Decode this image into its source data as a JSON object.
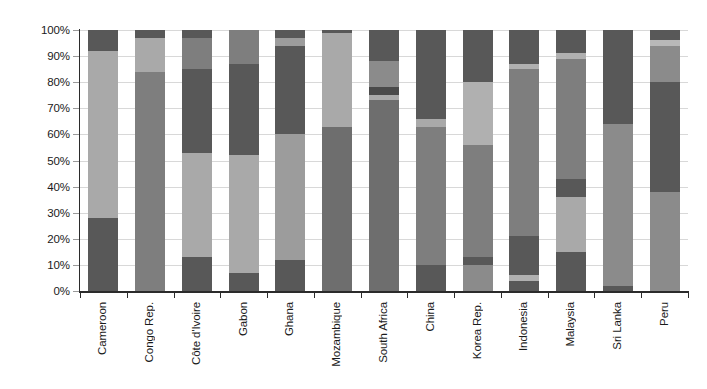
{
  "chart_data": {
    "type": "bar",
    "subtype": "stacked-bar-100-percent",
    "title": "",
    "subtitle": "",
    "xlabel": "",
    "ylabel": "",
    "ylim": [
      0,
      100
    ],
    "grid": true,
    "legend": "none",
    "y_tick_labels": [
      "0%",
      "10%",
      "20%",
      "30%",
      "40%",
      "50%",
      "60%",
      "70%",
      "80%",
      "90%",
      "100%"
    ],
    "y_tick_values": [
      0,
      10,
      20,
      30,
      40,
      50,
      60,
      70,
      80,
      90,
      100
    ],
    "categories": [
      "Cameroon",
      "Congo Rep.",
      "Côte d'Ivoire",
      "Gabon",
      "Ghana",
      "Mozambique",
      "South Africa",
      "China",
      "Korea Rep.",
      "Indonesia",
      "Malaysia",
      "Sri Lanka",
      "Peru"
    ],
    "colors": {
      "dark": "#585858",
      "dark_extra": "#4a4a4a",
      "medium": "#7e7e7e",
      "light": "#a9a9a9",
      "pale": "#c4c4c4"
    },
    "stacks": [
      {
        "category": "Cameroon",
        "segments": [
          {
            "from": 0,
            "to": 28,
            "value": 28,
            "color": "#585858"
          },
          {
            "from": 28,
            "to": 92,
            "value": 64,
            "color": "#a9a9a9"
          },
          {
            "from": 92,
            "to": 100,
            "value": 8,
            "color": "#585858"
          }
        ]
      },
      {
        "category": "Congo Rep.",
        "segments": [
          {
            "from": 0,
            "to": 84,
            "value": 84,
            "color": "#7e7e7e"
          },
          {
            "from": 84,
            "to": 97,
            "value": 13,
            "color": "#a9a9a9"
          },
          {
            "from": 97,
            "to": 100,
            "value": 3,
            "color": "#585858"
          }
        ]
      },
      {
        "category": "Côte d'Ivoire",
        "segments": [
          {
            "from": 0,
            "to": 13,
            "value": 13,
            "color": "#585858"
          },
          {
            "from": 13,
            "to": 53,
            "value": 40,
            "color": "#a9a9a9"
          },
          {
            "from": 53,
            "to": 85,
            "value": 32,
            "color": "#585858"
          },
          {
            "from": 85,
            "to": 97,
            "value": 12,
            "color": "#7e7e7e"
          },
          {
            "from": 97,
            "to": 100,
            "value": 3,
            "color": "#585858"
          }
        ]
      },
      {
        "category": "Gabon",
        "segments": [
          {
            "from": 0,
            "to": 7,
            "value": 7,
            "color": "#585858"
          },
          {
            "from": 7,
            "to": 52,
            "value": 45,
            "color": "#a9a9a9"
          },
          {
            "from": 52,
            "to": 87,
            "value": 35,
            "color": "#585858"
          },
          {
            "from": 87,
            "to": 100,
            "value": 13,
            "color": "#7e7e7e"
          }
        ]
      },
      {
        "category": "Ghana",
        "segments": [
          {
            "from": 0,
            "to": 12,
            "value": 12,
            "color": "#585858"
          },
          {
            "from": 12,
            "to": 60,
            "value": 48,
            "color": "#9c9c9c"
          },
          {
            "from": 60,
            "to": 94,
            "value": 34,
            "color": "#585858"
          },
          {
            "from": 94,
            "to": 97,
            "value": 3,
            "color": "#9c9c9c"
          },
          {
            "from": 97,
            "to": 100,
            "value": 3,
            "color": "#585858"
          }
        ]
      },
      {
        "category": "Mozambique",
        "segments": [
          {
            "from": 0,
            "to": 63,
            "value": 63,
            "color": "#6e6e6e"
          },
          {
            "from": 63,
            "to": 99,
            "value": 36,
            "color": "#a9a9a9"
          },
          {
            "from": 99,
            "to": 100,
            "value": 1,
            "color": "#585858"
          }
        ]
      },
      {
        "category": "South Africa",
        "segments": [
          {
            "from": 0,
            "to": 73,
            "value": 73,
            "color": "#6e6e6e"
          },
          {
            "from": 73,
            "to": 75,
            "value": 2,
            "color": "#a9a9a9"
          },
          {
            "from": 75,
            "to": 78,
            "value": 3,
            "color": "#4a4a4a"
          },
          {
            "from": 78,
            "to": 88,
            "value": 10,
            "color": "#8b8b8b"
          },
          {
            "from": 88,
            "to": 100,
            "value": 12,
            "color": "#585858"
          }
        ]
      },
      {
        "category": "China",
        "segments": [
          {
            "from": 0,
            "to": 10,
            "value": 10,
            "color": "#585858"
          },
          {
            "from": 10,
            "to": 63,
            "value": 53,
            "color": "#7e7e7e"
          },
          {
            "from": 63,
            "to": 66,
            "value": 3,
            "color": "#a9a9a9"
          },
          {
            "from": 66,
            "to": 100,
            "value": 34,
            "color": "#585858"
          }
        ]
      },
      {
        "category": "Korea Rep.",
        "segments": [
          {
            "from": 0,
            "to": 10,
            "value": 10,
            "color": "#8b8b8b"
          },
          {
            "from": 10,
            "to": 13,
            "value": 3,
            "color": "#585858"
          },
          {
            "from": 13,
            "to": 56,
            "value": 43,
            "color": "#7e7e7e"
          },
          {
            "from": 56,
            "to": 80,
            "value": 24,
            "color": "#b0b0b0"
          },
          {
            "from": 80,
            "to": 100,
            "value": 20,
            "color": "#585858"
          }
        ]
      },
      {
        "category": "Indonesia",
        "segments": [
          {
            "from": 0,
            "to": 4,
            "value": 4,
            "color": "#585858"
          },
          {
            "from": 4,
            "to": 6,
            "value": 2,
            "color": "#b0b0b0"
          },
          {
            "from": 6,
            "to": 21,
            "value": 15,
            "color": "#585858"
          },
          {
            "from": 21,
            "to": 85,
            "value": 64,
            "color": "#7e7e7e"
          },
          {
            "from": 85,
            "to": 87,
            "value": 2,
            "color": "#b0b0b0"
          },
          {
            "from": 87,
            "to": 100,
            "value": 13,
            "color": "#585858"
          }
        ]
      },
      {
        "category": "Malaysia",
        "segments": [
          {
            "from": 0,
            "to": 15,
            "value": 15,
            "color": "#585858"
          },
          {
            "from": 15,
            "to": 36,
            "value": 21,
            "color": "#a9a9a9"
          },
          {
            "from": 36,
            "to": 43,
            "value": 7,
            "color": "#585858"
          },
          {
            "from": 43,
            "to": 89,
            "value": 46,
            "color": "#7e7e7e"
          },
          {
            "from": 89,
            "to": 91,
            "value": 2,
            "color": "#b0b0b0"
          },
          {
            "from": 91,
            "to": 100,
            "value": 9,
            "color": "#585858"
          }
        ]
      },
      {
        "category": "Sri Lanka",
        "segments": [
          {
            "from": 0,
            "to": 2,
            "value": 2,
            "color": "#585858"
          },
          {
            "from": 2,
            "to": 64,
            "value": 62,
            "color": "#8b8b8b"
          },
          {
            "from": 64,
            "to": 100,
            "value": 36,
            "color": "#585858"
          }
        ]
      },
      {
        "category": "Peru",
        "segments": [
          {
            "from": 0,
            "to": 38,
            "value": 38,
            "color": "#8b8b8b"
          },
          {
            "from": 38,
            "to": 80,
            "value": 42,
            "color": "#585858"
          },
          {
            "from": 80,
            "to": 94,
            "value": 14,
            "color": "#8b8b8b"
          },
          {
            "from": 94,
            "to": 96,
            "value": 2,
            "color": "#b8b8b8"
          },
          {
            "from": 96,
            "to": 100,
            "value": 4,
            "color": "#585858"
          }
        ]
      }
    ]
  }
}
